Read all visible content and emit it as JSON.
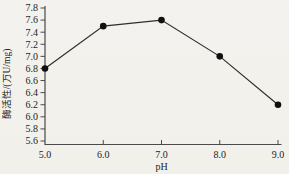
{
  "chart_data": {
    "type": "line",
    "title": "",
    "xlabel": "pH",
    "ylabel": "酶活性/(万U/mg)",
    "x": [
      5.0,
      6.0,
      7.0,
      8.0,
      9.0
    ],
    "series": [
      {
        "name": "酶活性",
        "values": [
          6.8,
          7.5,
          7.6,
          7.0,
          6.2
        ]
      }
    ],
    "xlim": [
      5.0,
      9.0
    ],
    "ylim": [
      5.6,
      7.8
    ],
    "x_tick_labels": [
      "5.0",
      "6.0",
      "7.0",
      "8.0",
      "9.0"
    ],
    "y_tick_labels": [
      "5.6",
      "5.8",
      "6.0",
      "6.2",
      "6.4",
      "6.6",
      "6.8",
      "7.0",
      "7.2",
      "7.4",
      "7.6",
      "7.8"
    ],
    "grid": false,
    "legend": "none",
    "marker": "filled-circle",
    "colors": {
      "line": "#2e2e2e",
      "marker": "#101010",
      "axis": "#4a4a4a",
      "text": "#1e1e1e",
      "background": "#f2f1ec"
    }
  }
}
